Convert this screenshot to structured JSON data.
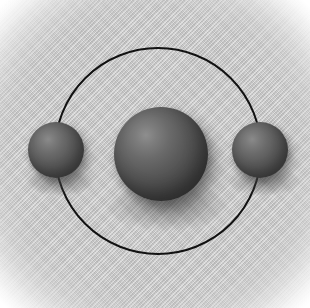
{
  "figure": {
    "name": "atom-model-diagram",
    "canvas": {
      "width": 310,
      "height": 308
    },
    "background": {
      "name": "soft-gray-radial-field",
      "center_color": "#c2c2c2",
      "edge_color": "#ffffff",
      "texture": "diagonal-hatch"
    }
  },
  "orbit": {
    "name": "electron-orbit-ring",
    "center_x": 158,
    "center_y": 151,
    "radius": 104,
    "stroke_color": "#121212",
    "stroke_width": 2
  },
  "particles": [
    {
      "name": "nucleus",
      "role": "nucleus",
      "center_x": 161,
      "center_y": 154,
      "diameter": 94,
      "highlight_color": "#8e8e8e",
      "shade_color": "#383838"
    },
    {
      "name": "electron-left",
      "role": "electron",
      "center_x": 56,
      "center_y": 150,
      "diameter": 56,
      "highlight_color": "#8a8a8a",
      "shade_color": "#404040"
    },
    {
      "name": "electron-right",
      "role": "electron",
      "center_x": 260,
      "center_y": 150,
      "diameter": 56,
      "highlight_color": "#8a8a8a",
      "shade_color": "#404040"
    }
  ]
}
